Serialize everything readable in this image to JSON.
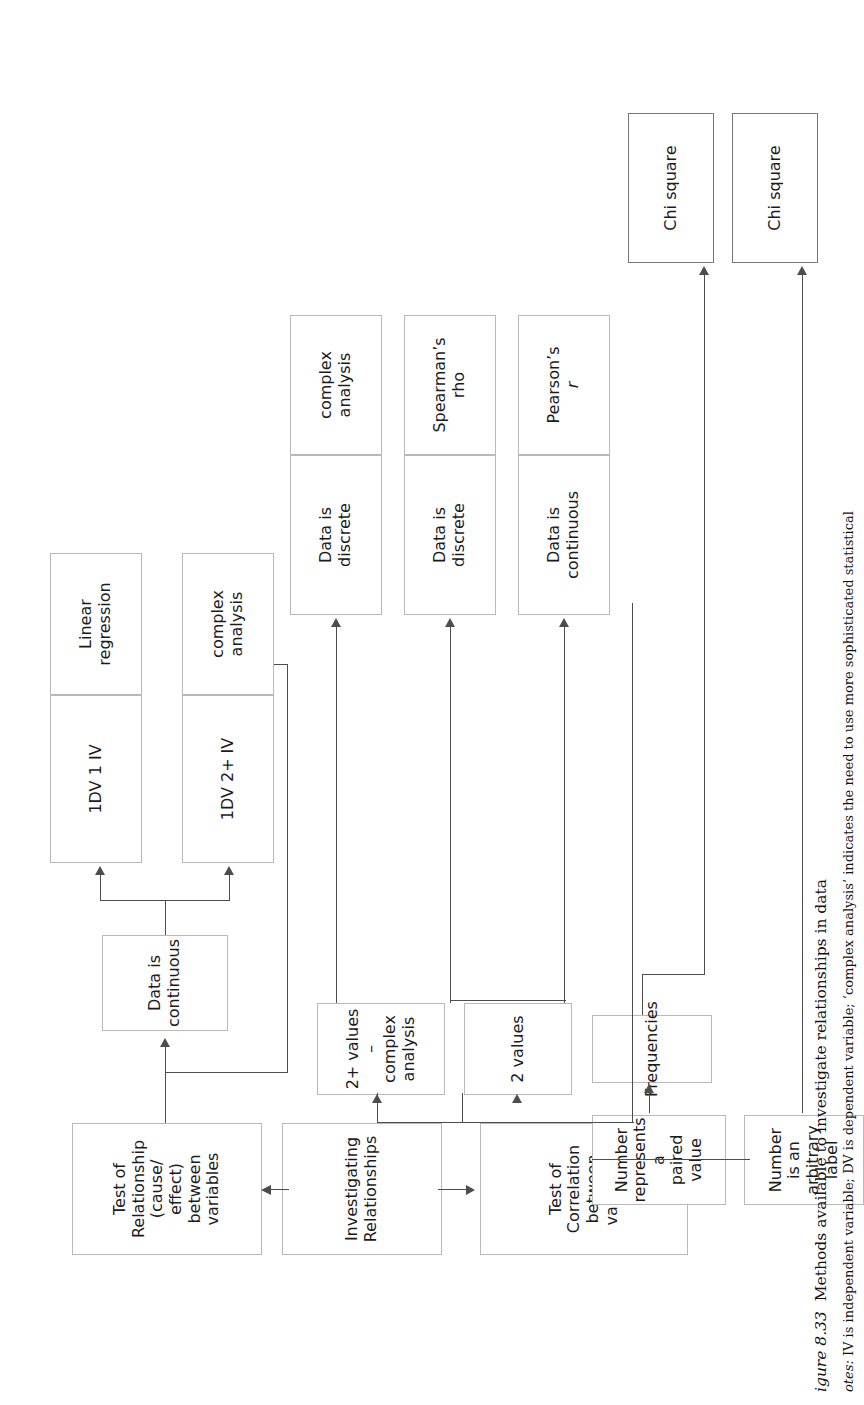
{
  "figure": {
    "number": "igure 8.33",
    "title": "Methods available to investigate relationships in data",
    "notes_label": "otes:",
    "notes_text": " IV is independent variable; DV is dependent variable; ‘complex analysis’ indicates the need to use more sophisticated statistical"
  },
  "diagram": {
    "type": "flowchart",
    "orientation": "rotated-90-ccw",
    "nodes": {
      "investigating": "Investigating\nRelationships",
      "test_correlation": "Test of\nCorrelation\nbetween\nvariables",
      "test_relationship": "Test of\nRelationship\n(cause/\neffect)\nbetween\nvariables",
      "data_continuous_mid": "Data is\ncontinuous",
      "two_plus_values": "2+ values –\ncomplex\nanalysis",
      "two_values": "2 values",
      "frequencies": "Frequencies",
      "number_paired": "Number\nrepresents a\npaired value",
      "number_label": "Number is an\narbitrary label",
      "dv1_iv1": "1DV 1 IV",
      "linear_regression": "Linear\nregression",
      "dv1_iv2plus": "1DV 2+ IV",
      "complex_analysis_1": "complex\nanalysis",
      "data_discrete_1": "Data is\ndiscrete",
      "complex_analysis_2": "complex\nanalysis",
      "data_discrete_2": "Data is\ndiscrete",
      "spearmans_rho": "Spearman’s\nrho",
      "data_continuous_2": "Data is\ncontinuous",
      "pearsons": "Pearson’s",
      "pearsons_sym": "r",
      "chi_square_1": "Chi square",
      "chi_square_2": "Chi square"
    },
    "colors": {
      "box_border": "#b9b9b9",
      "connector": "#4d4d4d",
      "text": "#1b1b1b",
      "background": "#ffffff"
    }
  }
}
